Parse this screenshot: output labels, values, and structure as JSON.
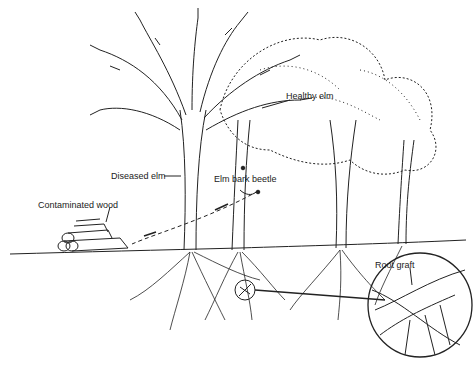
{
  "diagram": {
    "labels": {
      "contaminated_wood": "Contaminated wood",
      "diseased_elm": "Diseased elm",
      "elm_bark_beetle": "Elm bark beetle",
      "healthy_elm": "Healthy elm",
      "root_graft": "Root graft"
    },
    "colors": {
      "ink": "#222222",
      "background": "#ffffff"
    }
  }
}
